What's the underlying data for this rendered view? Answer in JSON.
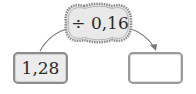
{
  "operator": {
    "label": "÷ 0,16"
  },
  "input_box": {
    "value": "1,28"
  },
  "output_box": {
    "value": ""
  },
  "colors": {
    "cloud_fill": "#e6e6e6",
    "cloud_border": "#8c8c8c",
    "arrow": "#7a7a7a",
    "input_fill": "#ececec",
    "output_fill": "#ffffff"
  }
}
